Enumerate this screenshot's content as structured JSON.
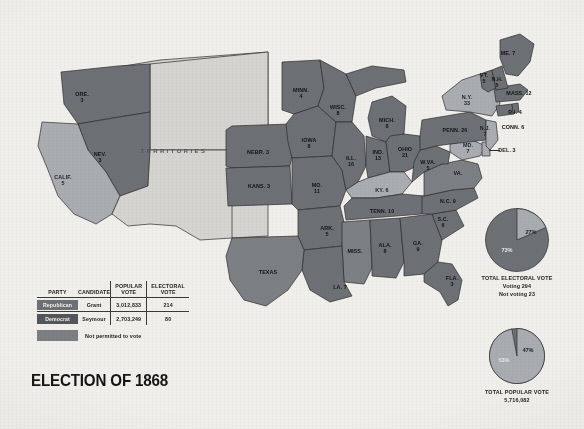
{
  "title": "ELECTION OF 1868",
  "territories_label": "TERRITORIES",
  "colors": {
    "republican": "#6d7176",
    "democrat": "#53565a",
    "not_permitted": "#7c7f84",
    "territory": "#d6d4d0",
    "background": "#f1efeb"
  },
  "legend": {
    "headers": {
      "party": "PARTY",
      "candidate": "CANDIDATE",
      "popular_vote": "POPULAR\nVOTE",
      "electoral_vote": "ELECTORAL\nVOTE"
    },
    "rows": [
      {
        "party": "Republican",
        "candidate": "Grant",
        "popular_vote": "3,012,833",
        "electoral_vote": "214"
      },
      {
        "party": "Democrat",
        "candidate": "Seymour",
        "popular_vote": "2,703,249",
        "electoral_vote": "80"
      }
    ],
    "not_permitted_label": "Not permitted to vote"
  },
  "chart_data": [
    {
      "type": "pie",
      "title": "TOTAL ELECTORAL VOTE",
      "subtitle_lines": [
        "Voting 294",
        "Not voting 23"
      ],
      "categories": [
        "73%",
        "27%"
      ],
      "values": [
        73,
        27
      ],
      "labels": [
        "73%",
        "27%"
      ],
      "colors": [
        "#6d7176",
        "#a9adb1"
      ],
      "legend": "none"
    },
    {
      "type": "pie",
      "title": "TOTAL POPULAR VOTE",
      "subtitle_lines": [
        "5,716,082"
      ],
      "categories": [
        "53%",
        "47%"
      ],
      "values": [
        53,
        47
      ],
      "labels": [
        "53%",
        "47%"
      ],
      "colors": [
        "#6d7176",
        "#a9adb1"
      ],
      "legend": "none"
    }
  ],
  "pies": {
    "electoral": {
      "caption_line1": "TOTAL ELECTORAL VOTE",
      "caption_line2": "Voting 294",
      "caption_line3": "Not voting 23",
      "major_pct": "73%",
      "minor_pct": "27%"
    },
    "popular": {
      "caption_line1": "TOTAL POPULAR VOTE",
      "caption_line2": "5,716,082",
      "major_pct": "53%",
      "minor_pct": "47%"
    }
  },
  "states": [
    {
      "name": "ORE",
      "label": "ORE.\n3",
      "x": 82,
      "y": 97,
      "party": "rep"
    },
    {
      "name": "NEV",
      "label": "NEV.\n3",
      "x": 100,
      "y": 157,
      "party": "rep"
    },
    {
      "name": "CALIF",
      "label": "CALIF.\n5",
      "x": 63,
      "y": 180,
      "party": "dem"
    },
    {
      "name": "NEBR",
      "label": "NEBR. 3",
      "x": 258,
      "y": 152,
      "party": "rep"
    },
    {
      "name": "KANS",
      "label": "KANS. 3",
      "x": 259,
      "y": 186,
      "party": "rep"
    },
    {
      "name": "MINN",
      "label": "MINN.\n4",
      "x": 301,
      "y": 93,
      "party": "rep"
    },
    {
      "name": "IOWA",
      "label": "IOWA\n8",
      "x": 309,
      "y": 143,
      "party": "rep"
    },
    {
      "name": "WISC",
      "label": "WISC.\n8",
      "x": 338,
      "y": 110,
      "party": "rep"
    },
    {
      "name": "MO",
      "label": "MO.\n11",
      "x": 317,
      "y": 188,
      "party": "rep"
    },
    {
      "name": "ILL",
      "label": "ILL.\n16",
      "x": 351,
      "y": 161,
      "party": "rep"
    },
    {
      "name": "MICH",
      "label": "MICH.\n8",
      "x": 387,
      "y": 123,
      "party": "rep"
    },
    {
      "name": "IND",
      "label": "IND.\n13",
      "x": 378,
      "y": 155,
      "party": "rep"
    },
    {
      "name": "OHIO",
      "label": "OHIO\n21",
      "x": 405,
      "y": 152,
      "party": "rep"
    },
    {
      "name": "KY",
      "label": "KY. 6",
      "x": 382,
      "y": 190,
      "party": "dem"
    },
    {
      "name": "ARK",
      "label": "ARK.\n5",
      "x": 327,
      "y": 231,
      "party": "rep"
    },
    {
      "name": "TENN",
      "label": "TENN. 10",
      "x": 382,
      "y": 211,
      "party": "rep"
    },
    {
      "name": "MISS",
      "label": "MISS.",
      "x": 355,
      "y": 251,
      "party": "novote"
    },
    {
      "name": "ALA",
      "label": "ALA.\n8",
      "x": 385,
      "y": 248,
      "party": "rep"
    },
    {
      "name": "GA",
      "label": "GA.\n9",
      "x": 418,
      "y": 246,
      "party": "rep"
    },
    {
      "name": "LA",
      "label": "LA. 7",
      "x": 340,
      "y": 287,
      "party": "rep"
    },
    {
      "name": "FLA",
      "label": "FLA.\n3",
      "x": 452,
      "y": 281,
      "party": "rep"
    },
    {
      "name": "TEXAS",
      "label": "TEXAS",
      "x": 268,
      "y": 272,
      "party": "novote"
    },
    {
      "name": "SC",
      "label": "S.C.\n6",
      "x": 443,
      "y": 222,
      "party": "rep"
    },
    {
      "name": "NC",
      "label": "N.C. 9",
      "x": 448,
      "y": 201,
      "party": "rep"
    },
    {
      "name": "VA",
      "label": "VA.",
      "x": 458,
      "y": 173,
      "party": "novote"
    },
    {
      "name": "WVA",
      "label": "W.VA.\n5",
      "x": 428,
      "y": 165,
      "party": "rep"
    },
    {
      "name": "MD",
      "label": "MD.\n7",
      "x": 468,
      "y": 148,
      "party": "dem"
    },
    {
      "name": "DEL",
      "label": "DEL. 3",
      "x": 507,
      "y": 150,
      "party": "dem"
    },
    {
      "name": "PENN",
      "label": "PENN. 26",
      "x": 455,
      "y": 130,
      "party": "rep"
    },
    {
      "name": "NJ",
      "label": "N.J.\n7",
      "x": 485,
      "y": 131,
      "party": "dem"
    },
    {
      "name": "NY",
      "label": "N.Y.\n33",
      "x": 467,
      "y": 100,
      "party": "dem"
    },
    {
      "name": "CONN",
      "label": "CONN. 6",
      "x": 513,
      "y": 127,
      "party": "rep"
    },
    {
      "name": "RI",
      "label": "R.I. 4",
      "x": 515,
      "y": 112,
      "party": "rep"
    },
    {
      "name": "MASS",
      "label": "MASS. 12",
      "x": 519,
      "y": 93,
      "party": "rep"
    },
    {
      "name": "VT",
      "label": "VT.\n5",
      "x": 484,
      "y": 78,
      "party": "rep"
    },
    {
      "name": "NH",
      "label": "N.H.\n5",
      "x": 497,
      "y": 82,
      "party": "rep"
    },
    {
      "name": "ME",
      "label": "ME. 7",
      "x": 508,
      "y": 53,
      "party": "rep"
    }
  ]
}
